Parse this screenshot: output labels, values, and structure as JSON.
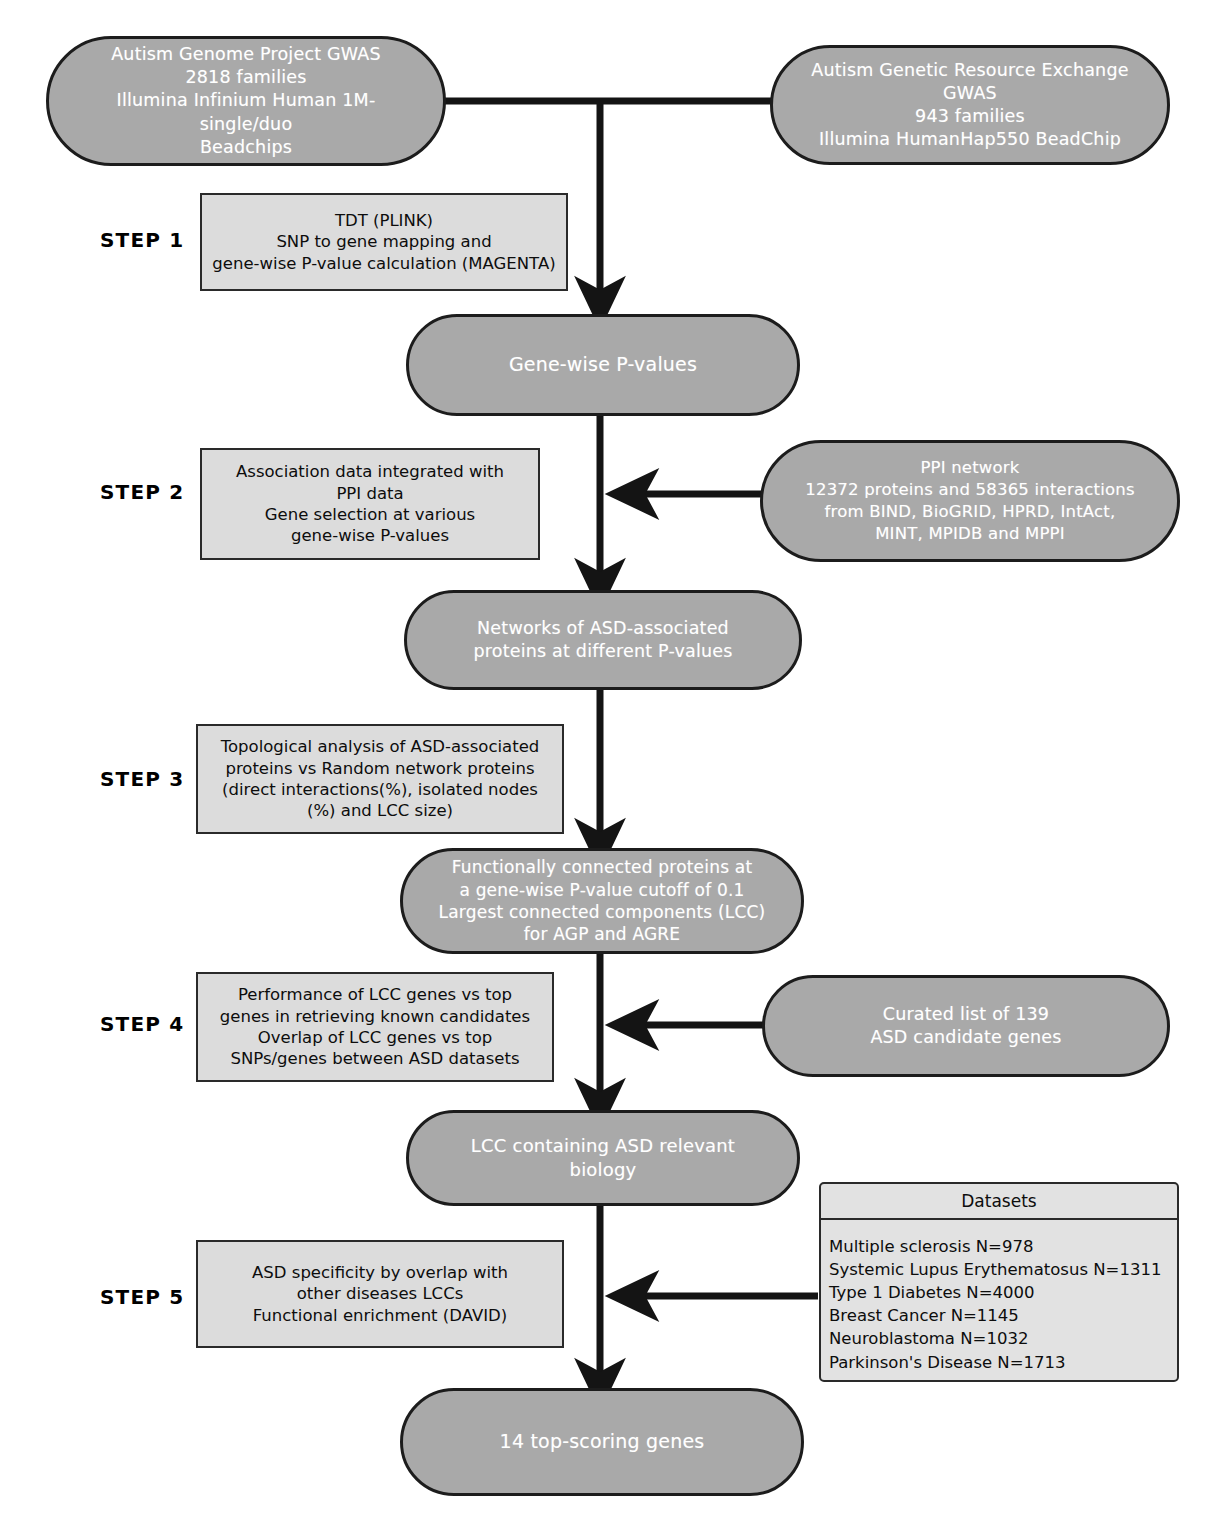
{
  "figure": {
    "type": "flowchart",
    "colors": {
      "node_fill": "#a9a9a9",
      "node_text": "#ffffff",
      "process_fill": "#dcdcdc",
      "panel_fill": "#e2e2e2",
      "stroke": "#1c1c1c",
      "background": "#ffffff"
    }
  },
  "steps": [
    {
      "id": "step1",
      "label": "STEP 1"
    },
    {
      "id": "step2",
      "label": "STEP 2"
    },
    {
      "id": "step3",
      "label": "STEP 3"
    },
    {
      "id": "step4",
      "label": "STEP 4"
    },
    {
      "id": "step5",
      "label": "STEP 5"
    }
  ],
  "inputs": {
    "agp": {
      "line1": "Autism Genome Project GWAS",
      "line2": "2818 families",
      "line3": "Illumina Infinium Human 1M-single/duo",
      "line4": "Beadchips"
    },
    "agre": {
      "line1": "Autism Genetic Resource Exchange",
      "line2": "GWAS",
      "line3": "943 families",
      "line4": "Illumina HumanHap550 BeadChip"
    },
    "ppi": {
      "line1": "PPI network",
      "line2": "12372 proteins and 58365 interactions",
      "line3": "from BIND, BioGRID, HPRD, IntAct,",
      "line4": "MINT, MPIDB and MPPI"
    },
    "curated": {
      "line1": "Curated list of 139",
      "line2": "ASD candidate genes"
    }
  },
  "processes": {
    "step1": {
      "line1": "TDT (PLINK)",
      "line2": "SNP to gene mapping and",
      "line3": "gene-wise P-value calculation (MAGENTA)"
    },
    "step2": {
      "line1": "Association  data integrated with",
      "line2": "PPI data",
      "line3": "Gene selection at various",
      "line4": "gene-wise P-values"
    },
    "step3": {
      "line1": "Topological analysis of ASD-associated",
      "line2": "proteins vs Random network proteins",
      "line3": "(direct interactions(%), isolated nodes",
      "line4": "(%) and LCC size)"
    },
    "step4": {
      "line1": "Performance of LCC genes vs top",
      "line2": "genes in retrieving known candidates",
      "line3": "Overlap of LCC genes vs top",
      "line4": "SNPs/genes between ASD datasets"
    },
    "step5": {
      "line1": "ASD specificity by overlap with",
      "line2": "other diseases LCCs",
      "line3": "Functional enrichment (DAVID)"
    }
  },
  "outputs": {
    "gene_wise_pvalues": {
      "line1": "Gene-wise P-values"
    },
    "networks": {
      "line1": "Networks of ASD-associated",
      "line2": "proteins at different P-values"
    },
    "functional": {
      "line1": "Functionally connected proteins at",
      "line2": "a gene-wise P-value cutoff of 0.1",
      "line3": "Largest connected components (LCC)",
      "line4": "for AGP and AGRE"
    },
    "lcc_biology": {
      "line1": "LCC containing ASD relevant biology"
    },
    "top_genes": {
      "line1": "14 top-scoring genes"
    }
  },
  "datasets_panel": {
    "title": "Datasets",
    "rows": [
      "Multiple sclerosis N=978",
      "Systemic Lupus Erythematosus N=1311",
      "Type 1 Diabetes N=4000",
      "Breast Cancer N=1145",
      "Neuroblastoma N=1032",
      "Parkinson's Disease N=1713"
    ]
  }
}
